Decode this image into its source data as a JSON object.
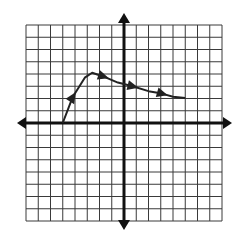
{
  "chart_data": {
    "type": "line",
    "title": "",
    "xlabel": "",
    "ylabel": "",
    "xlim": [
      -8,
      8
    ],
    "ylim": [
      -8,
      8
    ],
    "grid": true,
    "grid_step": 1,
    "axes_arrows": true,
    "tick_labels": [],
    "legend": [],
    "series": [
      {
        "name": "f(x)",
        "points": [
          [
            -5,
            0
          ],
          [
            -4.2,
            2.1
          ],
          [
            -3.2,
            3.7
          ],
          [
            -2.6,
            4.1
          ],
          [
            -1.7,
            3.8
          ],
          [
            -0.5,
            3.3
          ],
          [
            0.7,
            3.0
          ],
          [
            2.0,
            2.6
          ],
          [
            3.1,
            2.4
          ],
          [
            4.0,
            2.15
          ],
          [
            5,
            2.05
          ]
        ],
        "direction_arrows": [
          {
            "at": [
              -4.2,
              2.1
            ],
            "direction": "up"
          },
          {
            "at": [
              -1.7,
              3.8
            ],
            "direction": "down-right"
          },
          {
            "at": [
              0.7,
              3.0
            ],
            "direction": "down-right"
          },
          {
            "at": [
              3.1,
              2.4
            ],
            "direction": "down-right"
          }
        ]
      }
    ]
  },
  "colors": {
    "background": "#ffffff",
    "grid": "#3a3a3a",
    "axis": "#111111",
    "curve": "#222222"
  }
}
